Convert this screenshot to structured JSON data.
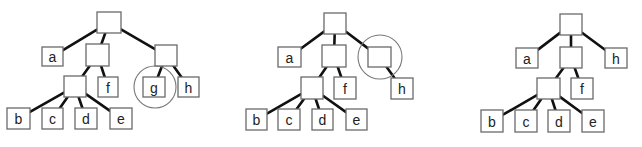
{
  "diagram": {
    "title": "",
    "colors": {
      "edge": "#111111",
      "box_border": "#6a6a6a",
      "circle": "#777777",
      "background": "#ffffff"
    },
    "trees": [
      {
        "id": "tree-1",
        "nodes": [
          {
            "id": "root",
            "label": "",
            "x": 97,
            "y": 12,
            "w": 24,
            "h": 21
          },
          {
            "id": "a",
            "label": "a",
            "x": 42,
            "y": 47,
            "w": 21,
            "h": 19
          },
          {
            "id": "n1",
            "label": "",
            "x": 86,
            "y": 44,
            "w": 23,
            "h": 22
          },
          {
            "id": "n2",
            "label": "",
            "x": 155,
            "y": 45,
            "w": 22,
            "h": 21
          },
          {
            "id": "n3",
            "label": "",
            "x": 64,
            "y": 76,
            "w": 22,
            "h": 21
          },
          {
            "id": "f",
            "label": "f",
            "x": 98,
            "y": 77,
            "w": 20,
            "h": 20
          },
          {
            "id": "g",
            "label": "g",
            "x": 143,
            "y": 77,
            "w": 22,
            "h": 20
          },
          {
            "id": "h",
            "label": "h",
            "x": 178,
            "y": 77,
            "w": 21,
            "h": 20
          },
          {
            "id": "b",
            "label": "b",
            "x": 7,
            "y": 108,
            "w": 23,
            "h": 21
          },
          {
            "id": "c",
            "label": "c",
            "x": 42,
            "y": 108,
            "w": 21,
            "h": 21
          },
          {
            "id": "d",
            "label": "d",
            "x": 75,
            "y": 108,
            "w": 22,
            "h": 21
          },
          {
            "id": "e",
            "label": "e",
            "x": 110,
            "y": 108,
            "w": 22,
            "h": 21
          }
        ],
        "edges": [
          [
            "root",
            "a"
          ],
          [
            "root",
            "n1"
          ],
          [
            "root",
            "n2"
          ],
          [
            "n1",
            "n3"
          ],
          [
            "n1",
            "f"
          ],
          [
            "n2",
            "g"
          ],
          [
            "n2",
            "h"
          ],
          [
            "n3",
            "b"
          ],
          [
            "n3",
            "c"
          ],
          [
            "n3",
            "d"
          ],
          [
            "n3",
            "e"
          ]
        ],
        "highlight": {
          "node": "g",
          "cx": 155,
          "cy": 87,
          "r": 21
        }
      },
      {
        "id": "tree-2",
        "nodes": [
          {
            "id": "root",
            "label": "",
            "x": 324,
            "y": 13,
            "w": 22,
            "h": 21
          },
          {
            "id": "a",
            "label": "a",
            "x": 278,
            "y": 47,
            "w": 23,
            "h": 20
          },
          {
            "id": "n1",
            "label": "",
            "x": 322,
            "y": 45,
            "w": 24,
            "h": 22
          },
          {
            "id": "n2",
            "label": "",
            "x": 368,
            "y": 47,
            "w": 23,
            "h": 20
          },
          {
            "id": "n3",
            "label": "",
            "x": 301,
            "y": 77,
            "w": 22,
            "h": 22
          },
          {
            "id": "f",
            "label": "f",
            "x": 334,
            "y": 77,
            "w": 22,
            "h": 22
          },
          {
            "id": "h",
            "label": "h",
            "x": 391,
            "y": 78,
            "w": 22,
            "h": 21
          },
          {
            "id": "b",
            "label": "b",
            "x": 246,
            "y": 109,
            "w": 21,
            "h": 21
          },
          {
            "id": "c",
            "label": "c",
            "x": 278,
            "y": 109,
            "w": 22,
            "h": 21
          },
          {
            "id": "d",
            "label": "d",
            "x": 312,
            "y": 109,
            "w": 21,
            "h": 21
          },
          {
            "id": "e",
            "label": "e",
            "x": 346,
            "y": 109,
            "w": 21,
            "h": 21
          }
        ],
        "edges": [
          [
            "root",
            "a"
          ],
          [
            "root",
            "n1"
          ],
          [
            "root",
            "n2"
          ],
          [
            "n1",
            "n3"
          ],
          [
            "n1",
            "f"
          ],
          [
            "n2",
            "h"
          ],
          [
            "n3",
            "b"
          ],
          [
            "n3",
            "c"
          ],
          [
            "n3",
            "d"
          ],
          [
            "n3",
            "e"
          ]
        ],
        "highlight": {
          "node": "n2",
          "cx": 380,
          "cy": 57,
          "r": 22
        }
      },
      {
        "id": "tree-3",
        "nodes": [
          {
            "id": "root",
            "label": "",
            "x": 560,
            "y": 14,
            "w": 22,
            "h": 21
          },
          {
            "id": "a",
            "label": "a",
            "x": 516,
            "y": 48,
            "w": 22,
            "h": 20
          },
          {
            "id": "n1",
            "label": "",
            "x": 560,
            "y": 47,
            "w": 22,
            "h": 21
          },
          {
            "id": "h",
            "label": "h",
            "x": 605,
            "y": 48,
            "w": 22,
            "h": 20
          },
          {
            "id": "n3",
            "label": "",
            "x": 537,
            "y": 78,
            "w": 23,
            "h": 21
          },
          {
            "id": "f",
            "label": "f",
            "x": 571,
            "y": 78,
            "w": 22,
            "h": 21
          },
          {
            "id": "b",
            "label": "b",
            "x": 481,
            "y": 110,
            "w": 22,
            "h": 22
          },
          {
            "id": "c",
            "label": "c",
            "x": 515,
            "y": 110,
            "w": 22,
            "h": 22
          },
          {
            "id": "d",
            "label": "d",
            "x": 548,
            "y": 110,
            "w": 22,
            "h": 22
          },
          {
            "id": "e",
            "label": "e",
            "x": 582,
            "y": 110,
            "w": 22,
            "h": 22
          }
        ],
        "edges": [
          [
            "root",
            "a"
          ],
          [
            "root",
            "n1"
          ],
          [
            "root",
            "h"
          ],
          [
            "n1",
            "n3"
          ],
          [
            "n1",
            "f"
          ],
          [
            "n3",
            "b"
          ],
          [
            "n3",
            "c"
          ],
          [
            "n3",
            "d"
          ],
          [
            "n3",
            "e"
          ]
        ],
        "highlight": null
      }
    ]
  }
}
